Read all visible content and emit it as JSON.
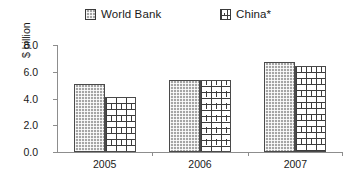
{
  "chart_data": {
    "type": "bar",
    "title": "",
    "subtitle": "",
    "xlabel": "",
    "ylabel": "$ billion",
    "categories": [
      "2005",
      "2006",
      "2007"
    ],
    "series": [
      {
        "name": "World Bank",
        "values": [
          5.1,
          5.35,
          6.75
        ],
        "pattern": "dotted-grey",
        "color": "#a5a5a5"
      },
      {
        "name": "China*",
        "values": [
          4.1,
          5.4,
          6.4
        ],
        "pattern": "brick-white",
        "color": "#ffffff"
      }
    ],
    "ylim": [
      0.0,
      8.0
    ],
    "ytick_step": 2.0,
    "ytick_labels": [
      "0.0",
      "2.0",
      "4.0",
      "6.0",
      "8.0"
    ],
    "ytick_values": [
      0.0,
      2.0,
      4.0,
      6.0,
      8.0
    ],
    "grid": false,
    "legend_position": "top",
    "annotations": []
  },
  "legend": {
    "entries": [
      {
        "label": "World Bank",
        "swatch": "legend-swatch-world-bank"
      },
      {
        "label": "China*",
        "swatch": "legend-swatch-china"
      }
    ]
  },
  "axes": {
    "y_title": "$ billion",
    "y_labels": [
      "8.0",
      "6.0",
      "4.0",
      "2.0",
      "0.0"
    ],
    "x_labels": [
      "2005",
      "2006",
      "2007"
    ]
  },
  "colors": {
    "axis": "#8d8d8d",
    "bar_outline": "#4a4a4a",
    "world_bank_fill": "#a5a5a5",
    "china_fill": "#ffffff",
    "text": "#1a1a1a",
    "background": "#ffffff"
  }
}
